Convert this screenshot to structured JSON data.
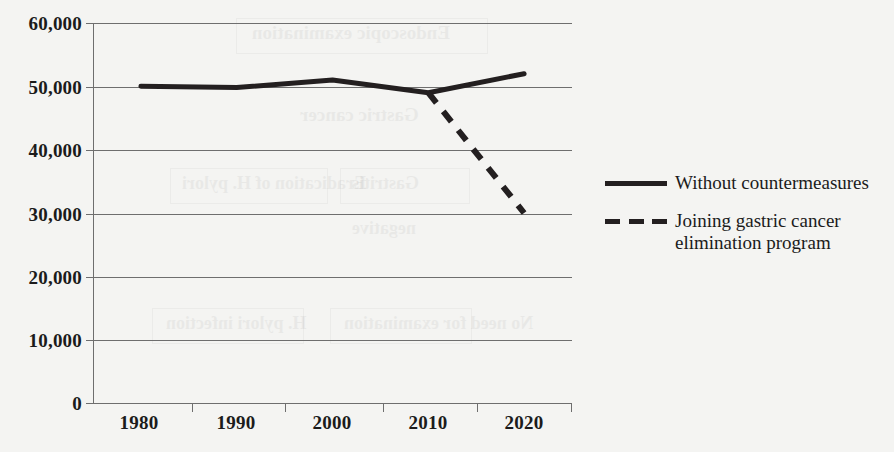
{
  "chart_data": {
    "type": "line",
    "title": "",
    "xlabel": "",
    "ylabel": "",
    "categories": [
      "1980",
      "1990",
      "2000",
      "2010",
      "2020"
    ],
    "x_tick_labels": [
      "1980",
      "1990",
      "2000",
      "2010",
      "2020"
    ],
    "y_tick_labels": [
      "0",
      "10,000",
      "20,000",
      "30,000",
      "40,000",
      "50,000",
      "60,000"
    ],
    "y_tick_values": [
      0,
      10000,
      20000,
      30000,
      40000,
      50000,
      60000
    ],
    "ylim": [
      0,
      60000
    ],
    "grid": "horizontal",
    "legend_position": "right",
    "series": [
      {
        "name": "Without countermeasures",
        "style": "solid",
        "color": "#231f20",
        "x": [
          "1980",
          "1990",
          "2000",
          "2010",
          "2020"
        ],
        "values": [
          50000,
          49800,
          51000,
          49000,
          52000
        ]
      },
      {
        "name": "Joining gastric cancer elimination program",
        "style": "dashed",
        "color": "#231f20",
        "x": [
          "2010",
          "2020"
        ],
        "values": [
          49000,
          30000
        ]
      }
    ]
  },
  "legend": {
    "items": [
      {
        "label": "Without countermeasures",
        "marker": "solid-line-marker"
      },
      {
        "label": "Joining gastric cancer elimination program",
        "marker": "dashed-line-marker"
      }
    ]
  },
  "ghost_text": {
    "lines": [
      "Endoscopic examination",
      "Gastric cancer",
      "Eradication of H. pylori",
      "Gastritis",
      "H. pylori infection",
      "negative",
      "No need for examination"
    ]
  },
  "colors": {
    "background": "#f4f4f2",
    "line": "#231f20",
    "grid": "#6e6e6e",
    "text": "#1b1b1b"
  }
}
